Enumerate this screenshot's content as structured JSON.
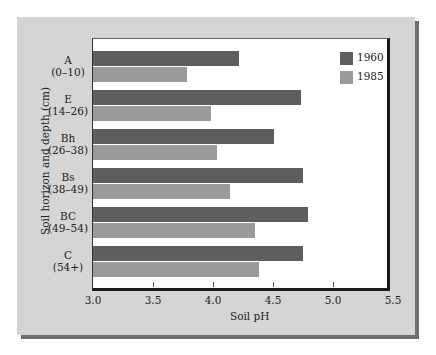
{
  "chart_data": {
    "type": "bar",
    "orientation": "horizontal",
    "title": "",
    "xlabel": "Soil pH",
    "ylabel": "Soil horizon and depth (cm)",
    "xlim": [
      3.0,
      5.5
    ],
    "xticks": [
      "3.0",
      "3.5",
      "4.0",
      "4.5",
      "5.0",
      "5.5"
    ],
    "grid": false,
    "legend_position": "top-right inside",
    "categories": [
      {
        "horizon": "A",
        "depth": "(0–10)"
      },
      {
        "horizon": "E",
        "depth": "(14–26)"
      },
      {
        "horizon": "Bh",
        "depth": "(26–38)"
      },
      {
        "horizon": "Bs",
        "depth": "(38–49)"
      },
      {
        "horizon": "BC",
        "depth": "(49–54)"
      },
      {
        "horizon": "C",
        "depth": "(54+)"
      }
    ],
    "series": [
      {
        "name": "1960",
        "color": "#5e5e5e",
        "values": [
          4.22,
          4.73,
          4.51,
          4.75,
          4.79,
          4.75
        ]
      },
      {
        "name": "1985",
        "color": "#9a9a9a",
        "values": [
          3.78,
          3.98,
          4.03,
          4.14,
          4.35,
          4.38
        ]
      }
    ]
  }
}
